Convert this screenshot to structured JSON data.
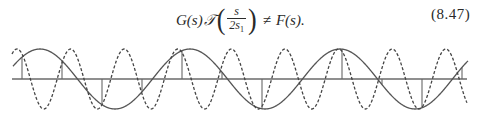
{
  "equation": {
    "lhs_function": "G(s)",
    "operator_symbol": "𝒯",
    "fraction_numerator": "s",
    "fraction_denominator_base": "2s",
    "fraction_denominator_subscript": "1",
    "relation": "≠",
    "rhs": "F(s).",
    "number": "(8.47)"
  },
  "figure": {
    "axis": {
      "x_start": 12,
      "x_end": 467,
      "y": 39
    },
    "dashed_wave": {
      "period_px": 53.6,
      "first_peak_x": 17,
      "amplitude_px": 30,
      "style": "dashed"
    },
    "solid_wave": {
      "period_px": 150,
      "first_peak_x": 40,
      "amplitude_px": 30,
      "style": "solid"
    },
    "sample_stems": {
      "first_x": 22,
      "spacing_px": 40,
      "count": 12
    },
    "colors": {
      "line": "#555555",
      "axis": "#6a6a6a"
    }
  }
}
